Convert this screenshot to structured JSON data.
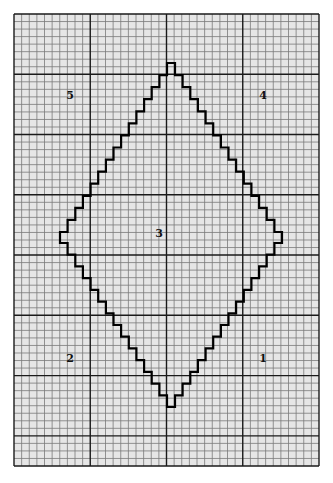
{
  "diagram": {
    "type": "grid-paper-diamond",
    "background": "#e6e6e6",
    "grid": {
      "origin_x": 14,
      "origin_y": 14,
      "cols": 40,
      "rows": 60,
      "cell_w": 7.625,
      "cell_h": 7.533,
      "major_every_cols": 10,
      "major_every_rows": 8,
      "minor_color": "#7a7a7a",
      "major_color": "#1a1a1a"
    },
    "diamond": {
      "stroke": "#000000",
      "top_peak": {
        "x1": 167,
        "x2": 175,
        "y": 63
      },
      "left_tip": {
        "x": 60,
        "y1": 232,
        "y2": 243
      },
      "right_tip": {
        "x": 282,
        "y1": 232,
        "y2": 243
      },
      "bottom_peak": {
        "x1": 167,
        "x2": 175,
        "y": 407
      },
      "steps_per_side": 14
    },
    "regions": [
      {
        "label": "1",
        "x": 263,
        "y": 362
      },
      {
        "label": "2",
        "x": 70,
        "y": 362
      },
      {
        "label": "3",
        "x": 159,
        "y": 237
      },
      {
        "label": "4",
        "x": 263,
        "y": 99
      },
      {
        "label": "5",
        "x": 70,
        "y": 99
      }
    ]
  }
}
